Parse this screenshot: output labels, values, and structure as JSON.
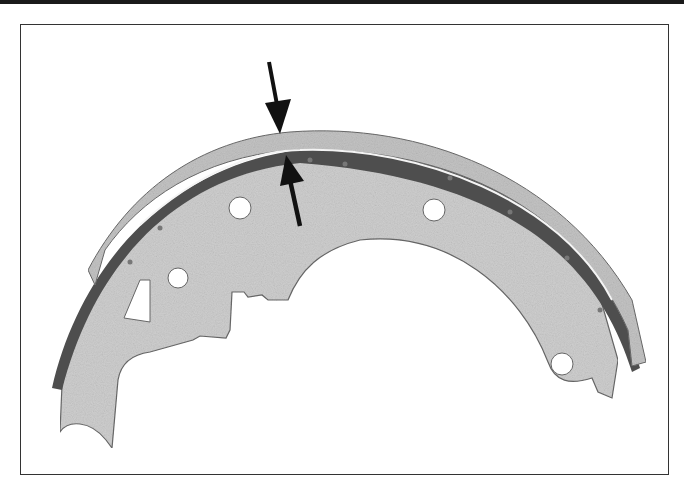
{
  "figure": {
    "colors": {
      "background": "#ffffff",
      "frame": "#333333",
      "metal": "#c9c9c9",
      "lining": "#bdbdbd",
      "web_shadow": "#555555",
      "arrow": "#111111"
    },
    "annotations": [
      {
        "type": "arrow",
        "direction": "down",
        "points_to": "lining-outer-surface"
      },
      {
        "type": "arrow",
        "direction": "up",
        "points_to": "lining-inner-surface"
      }
    ]
  }
}
